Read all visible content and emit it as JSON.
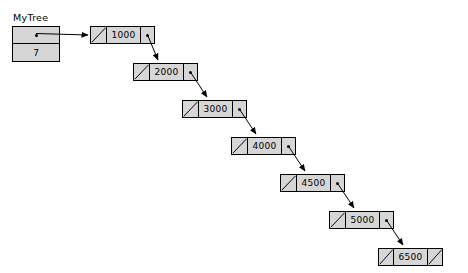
{
  "diagram": {
    "title": "MyTree",
    "header_box": {
      "pointer_cell_icon": "pointer-dot",
      "count_value": "7"
    },
    "node_fill_color": "#d6d6d6",
    "border_color": "#000000",
    "background_color": "#ffffff",
    "nodes": [
      {
        "value": "1000",
        "left": "null-slash",
        "right": "pointer-dot",
        "x": 90,
        "y": 26
      },
      {
        "value": "2000",
        "left": "null-slash",
        "right": "pointer-dot",
        "x": 133,
        "y": 63
      },
      {
        "value": "3000",
        "left": "null-slash",
        "right": "pointer-dot",
        "x": 182,
        "y": 100
      },
      {
        "value": "4000",
        "left": "null-slash",
        "right": "pointer-dot",
        "x": 231,
        "y": 137
      },
      {
        "value": "4500",
        "left": "null-slash",
        "right": "pointer-dot",
        "x": 280,
        "y": 174
      },
      {
        "value": "5000",
        "left": "null-slash",
        "right": "pointer-dot",
        "x": 329,
        "y": 211
      },
      {
        "value": "6500",
        "left": "null-slash",
        "right": "null-slash",
        "x": 378,
        "y": 248
      }
    ]
  }
}
